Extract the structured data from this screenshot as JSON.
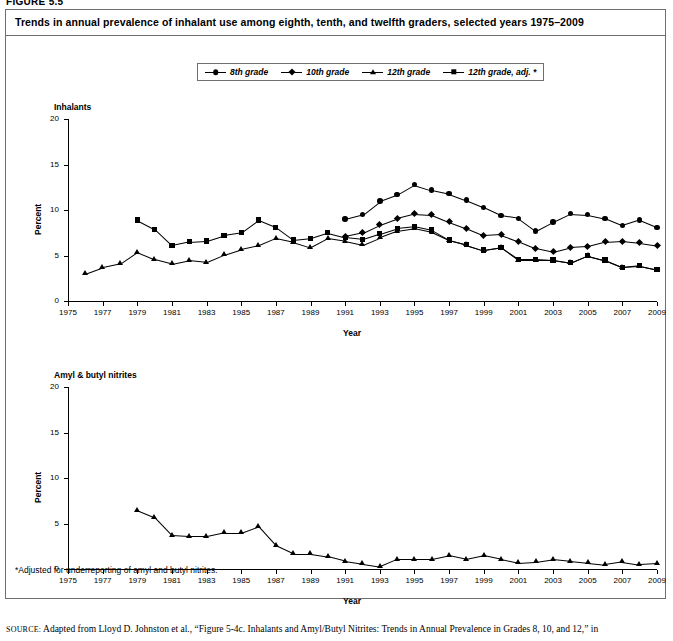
{
  "figure_label": "FIGURE 5.5",
  "chart_title": "Trends in annual prevalence of inhalant use among eighth, tenth, and twelfth graders, selected years 1975–2009",
  "legend": [
    {
      "label": "8th grade",
      "marker": "circle"
    },
    {
      "label": "10th grade",
      "marker": "diamond"
    },
    {
      "label": "12th grade",
      "marker": "tri"
    },
    {
      "label": "12th grade, adj. *",
      "marker": "square"
    }
  ],
  "footnote": "*Adjusted for underreporting of amyl and butyl nitrites.",
  "source_prefix": "SOURCE:",
  "source_text": " Adapted from Lloyd D. Johnston et al., “Figure 5-4c. Inhalants and Amyl/Butyl Nitrites: Trends in Annual Prevalence in Grades 8, 10, and 12,” in",
  "chart_data": [
    {
      "type": "line",
      "title": "Inhalants",
      "xlabel": "Year",
      "ylabel": "Percent",
      "xlim": [
        1975,
        2009
      ],
      "ylim": [
        0,
        20
      ],
      "yticks": [
        0,
        5,
        10,
        15,
        20
      ],
      "xticks": [
        1975,
        1977,
        1979,
        1981,
        1983,
        1985,
        1987,
        1989,
        1991,
        1993,
        1995,
        1997,
        1999,
        2001,
        2003,
        2005,
        2007,
        2009
      ],
      "grid": false,
      "legend_position": "top-center",
      "series": [
        {
          "name": "8th grade",
          "marker": "circle",
          "x": [
            1991,
            1992,
            1993,
            1994,
            1995,
            1996,
            1997,
            1998,
            1999,
            2000,
            2001,
            2002,
            2003,
            2004,
            2005,
            2006,
            2007,
            2008,
            2009
          ],
          "values": [
            9.0,
            9.5,
            11.0,
            11.7,
            12.8,
            12.2,
            11.8,
            11.1,
            10.3,
            9.4,
            9.1,
            7.7,
            8.7,
            9.6,
            9.5,
            9.1,
            8.3,
            8.9,
            8.1
          ]
        },
        {
          "name": "10th grade",
          "marker": "diamond",
          "x": [
            1991,
            1992,
            1993,
            1994,
            1995,
            1996,
            1997,
            1998,
            1999,
            2000,
            2001,
            2002,
            2003,
            2004,
            2005,
            2006,
            2007,
            2008,
            2009
          ],
          "values": [
            7.1,
            7.5,
            8.4,
            9.1,
            9.6,
            9.5,
            8.7,
            8.0,
            7.2,
            7.3,
            6.6,
            5.8,
            5.4,
            5.9,
            6.0,
            6.5,
            6.6,
            6.4,
            6.1
          ]
        },
        {
          "name": "12th grade",
          "marker": "tri",
          "x": [
            1976,
            1977,
            1978,
            1979,
            1980,
            1981,
            1982,
            1983,
            1984,
            1985,
            1986,
            1987,
            1988,
            1989,
            1990,
            1991,
            1992,
            1993,
            1994,
            1995,
            1996,
            1997,
            1998,
            1999,
            2000,
            2001,
            2002,
            2003,
            2004,
            2005,
            2006,
            2007,
            2008,
            2009
          ],
          "values": [
            3.0,
            3.7,
            4.1,
            5.4,
            4.6,
            4.1,
            4.5,
            4.3,
            5.1,
            5.7,
            6.1,
            6.9,
            6.5,
            5.9,
            6.9,
            6.6,
            6.2,
            7.0,
            7.7,
            8.0,
            7.6,
            6.7,
            6.2,
            5.6,
            5.9,
            4.5,
            4.5,
            4.5,
            4.2,
            5.0,
            4.5,
            3.7,
            3.8,
            3.4
          ]
        },
        {
          "name": "12th grade, adj.",
          "marker": "square",
          "x": [
            1979,
            1980,
            1981,
            1982,
            1983,
            1984,
            1985,
            1986,
            1987,
            1988,
            1989,
            1990,
            1991,
            1992,
            1993,
            1994,
            1995,
            1996,
            1997,
            1998,
            1999,
            2000,
            2001,
            2002,
            2003,
            2004,
            2005,
            2006,
            2007,
            2008,
            2009
          ],
          "values": [
            8.9,
            7.9,
            6.1,
            6.5,
            6.6,
            7.2,
            7.5,
            8.9,
            8.1,
            6.7,
            6.9,
            7.5,
            7.0,
            6.8,
            7.4,
            8.0,
            8.2,
            7.8,
            6.7,
            6.2,
            5.6,
            5.9,
            4.6,
            4.6,
            4.5,
            4.2,
            5.0,
            4.5,
            3.7,
            3.9,
            3.5
          ]
        }
      ]
    },
    {
      "type": "line",
      "title": "Amyl & butyl nitrites",
      "xlabel": "Year",
      "ylabel": "Percent",
      "xlim": [
        1975,
        2009
      ],
      "ylim": [
        0,
        20
      ],
      "yticks": [
        0,
        5,
        10,
        15,
        20
      ],
      "xticks": [
        1975,
        1977,
        1979,
        1981,
        1983,
        1985,
        1987,
        1989,
        1991,
        1993,
        1995,
        1997,
        1999,
        2001,
        2003,
        2005,
        2007,
        2009
      ],
      "grid": false,
      "series": [
        {
          "name": "12th grade",
          "marker": "tri",
          "x": [
            1979,
            1980,
            1981,
            1982,
            1983,
            1984,
            1985,
            1986,
            1987,
            1988,
            1989,
            1990,
            1991,
            1992,
            1993,
            1994,
            1995,
            1996,
            1997,
            1998,
            1999,
            2000,
            2001,
            2002,
            2003,
            2004,
            2005,
            2006,
            2007,
            2008,
            2009
          ],
          "values": [
            6.5,
            5.7,
            3.7,
            3.6,
            3.6,
            4.0,
            4.0,
            4.7,
            2.6,
            1.7,
            1.7,
            1.4,
            0.9,
            0.6,
            0.3,
            1.1,
            1.1,
            1.1,
            1.5,
            1.1,
            1.5,
            1.1,
            0.7,
            0.8,
            1.1,
            0.9,
            0.7,
            0.5,
            0.8,
            0.5,
            0.6,
            1.1
          ]
        }
      ]
    }
  ]
}
